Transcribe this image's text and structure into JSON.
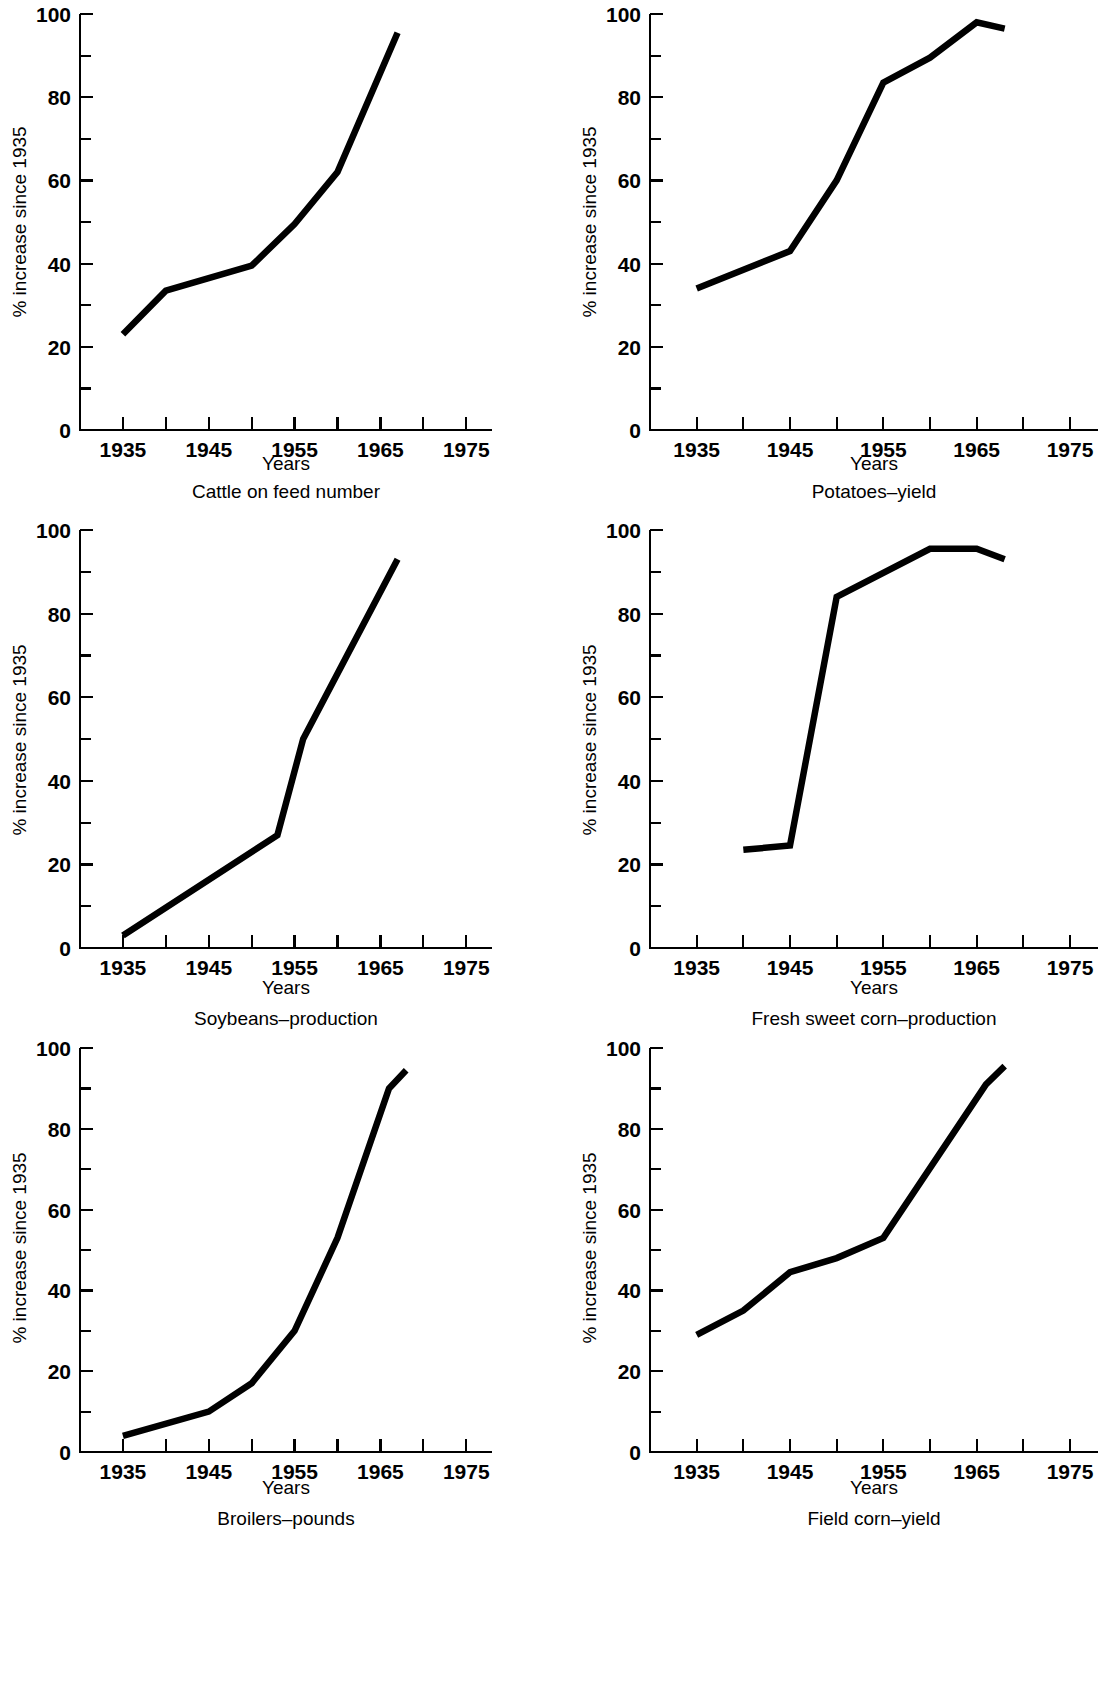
{
  "figure": {
    "background_color": "#ffffff",
    "line_color": "#000000",
    "panel_count": 6,
    "layout": "2 columns x 3 rows"
  },
  "common": {
    "ylabel": "% increase since 1935",
    "xlabel": "Years",
    "x_tick_labels": [
      "1935",
      "1945",
      "1955",
      "1965",
      "1975"
    ],
    "x_minor_ticks": [
      "1940",
      "1950",
      "1960",
      "1970"
    ],
    "y_tick_labels": [
      "0",
      "20",
      "40",
      "60",
      "80",
      "100"
    ],
    "y_minor_tick_values": [
      "10",
      "30",
      "50",
      "70",
      "90"
    ],
    "xlim": [
      1930,
      1978
    ],
    "ylim": [
      0,
      100
    ]
  },
  "chart_data": [
    {
      "type": "line",
      "title": "Cattle on feed number",
      "xlabel": "Years",
      "ylabel": "% increase since 1935",
      "xlim": [
        1930,
        1978
      ],
      "ylim": [
        0,
        100
      ],
      "grid": false,
      "legend": "none",
      "x": [
        1935,
        1940,
        1945,
        1950,
        1955,
        1960,
        1967
      ],
      "values": [
        23,
        33.5,
        36.5,
        39.5,
        49.5,
        62,
        95.5
      ]
    },
    {
      "type": "line",
      "title": "Potatoes–yield",
      "xlabel": "Years",
      "ylabel": "% increase since 1935",
      "xlim": [
        1930,
        1978
      ],
      "ylim": [
        0,
        100
      ],
      "grid": false,
      "legend": "none",
      "x": [
        1935,
        1945,
        1950,
        1955,
        1960,
        1965,
        1968
      ],
      "values": [
        34,
        43,
        60,
        83.5,
        89.5,
        98,
        96.5
      ]
    },
    {
      "type": "line",
      "title": "Soybeans–production",
      "xlabel": "Years",
      "ylabel": "% increase since 1935",
      "xlim": [
        1930,
        1978
      ],
      "ylim": [
        0,
        100
      ],
      "grid": false,
      "legend": "none",
      "x": [
        1935,
        1953,
        1956,
        1967
      ],
      "values": [
        3,
        27,
        50,
        93
      ]
    },
    {
      "type": "line",
      "title": "Fresh sweet corn–production",
      "xlabel": "Years",
      "ylabel": "% increase since 1935",
      "xlim": [
        1930,
        1978
      ],
      "ylim": [
        0,
        100
      ],
      "grid": false,
      "legend": "none",
      "x": [
        1940,
        1945,
        1950,
        1960,
        1965,
        1968
      ],
      "values": [
        23.5,
        24.5,
        84,
        95.5,
        95.5,
        93
      ]
    },
    {
      "type": "line",
      "title": "Broilers–pounds",
      "xlabel": "Years",
      "ylabel": "% increase since 1935",
      "xlim": [
        1930,
        1978
      ],
      "ylim": [
        0,
        100
      ],
      "grid": false,
      "legend": "none",
      "x": [
        1935,
        1945,
        1950,
        1955,
        1960,
        1966,
        1968
      ],
      "values": [
        4,
        10,
        17,
        30,
        53,
        90,
        94.5
      ]
    },
    {
      "type": "line",
      "title": "Field corn–yield",
      "xlabel": "Years",
      "ylabel": "% increase since 1935",
      "xlim": [
        1930,
        1978
      ],
      "ylim": [
        0,
        100
      ],
      "grid": false,
      "legend": "none",
      "x": [
        1935,
        1940,
        1945,
        1950,
        1955,
        1966,
        1968
      ],
      "values": [
        29,
        35,
        44.5,
        48,
        53,
        91,
        95.5
      ]
    }
  ],
  "panels": [
    {
      "caption": "Cattle on feed number",
      "xlabel": "Years",
      "ylabel": "% increase since 1935"
    },
    {
      "caption": "Potatoes–yield",
      "xlabel": "Years",
      "ylabel": "% increase since 1935"
    },
    {
      "caption": "Soybeans–production",
      "xlabel": "Years",
      "ylabel": "% increase since 1935"
    },
    {
      "caption": "Fresh sweet corn–production",
      "xlabel": "Years",
      "ylabel": "% increase since 1935"
    },
    {
      "caption": "Broilers–pounds",
      "xlabel": "Years",
      "ylabel": "% increase since 1935"
    },
    {
      "caption": "Field corn–yield",
      "xlabel": "Years",
      "ylabel": "% increase since 1935"
    }
  ]
}
